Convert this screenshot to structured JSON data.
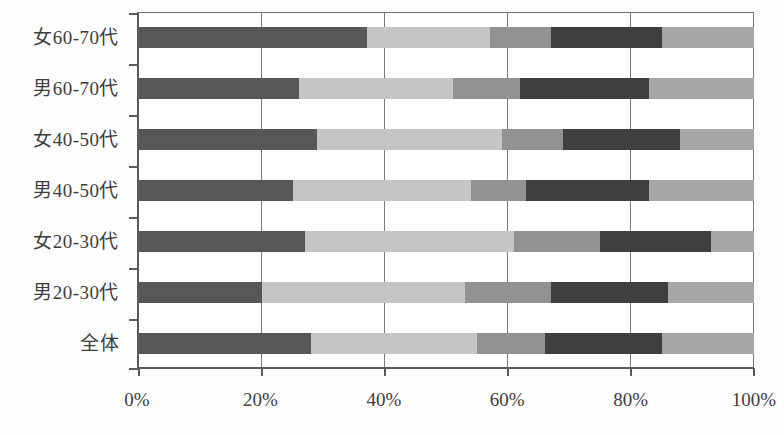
{
  "chart_data": {
    "type": "bar",
    "orientation": "horizontal",
    "stacked": true,
    "unit": "percent",
    "title": "",
    "xlabel": "",
    "ylabel": "",
    "xlim": [
      0,
      100
    ],
    "grid": "vertical",
    "legend": "none",
    "categories_top_to_bottom": [
      "女60-70代",
      "男60-70代",
      "女40-50代",
      "男40-50代",
      "女20-30代",
      "男20-30代",
      "全体"
    ],
    "x_tick_labels": [
      "0%",
      "20%",
      "40%",
      "60%",
      "80%",
      "100%"
    ],
    "x_tick_values": [
      0,
      20,
      40,
      60,
      80,
      100
    ],
    "series": [
      {
        "name": "segment-1-dark-gray",
        "color": "#575757",
        "values": [
          37,
          26,
          29,
          25,
          27,
          20,
          28
        ]
      },
      {
        "name": "segment-2-light-gray",
        "color": "#c5c5c5",
        "values": [
          20,
          25,
          30,
          29,
          34,
          33,
          27
        ]
      },
      {
        "name": "segment-3-medium-gray",
        "color": "#929292",
        "values": [
          10,
          11,
          10,
          9,
          14,
          14,
          11
        ]
      },
      {
        "name": "segment-4-darkest-gray",
        "color": "#3f3f3f",
        "values": [
          18,
          21,
          19,
          20,
          18,
          19,
          19
        ]
      },
      {
        "name": "segment-5-medium-light-gray",
        "color": "#a6a6a6",
        "values": [
          15,
          17,
          12,
          17,
          7,
          14,
          15
        ]
      }
    ]
  },
  "layout_colors": {
    "background": "#fdfdfd",
    "plot_background": "#ffffff",
    "gridline": "#7a7a7a",
    "axis": "#5a5a5a",
    "text": "#3d3d3d"
  }
}
